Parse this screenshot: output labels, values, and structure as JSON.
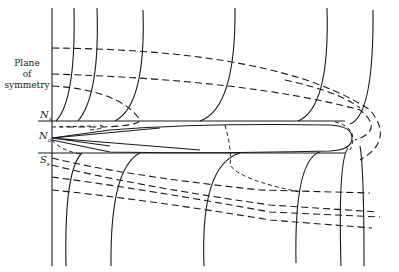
{
  "figure": {
    "labels": {
      "plane_line1": "Plane",
      "plane_line2": "of",
      "plane_line3": "symmetry",
      "ns_main": "N",
      "ns_sub": "s",
      "na_main": "N",
      "na_sub": "a",
      "ss_main": "S",
      "ss_sub": "s"
    },
    "legend": {
      "solid_lines": "field lines",
      "dashed_lines": "contours"
    },
    "colors": {
      "ink": "#1a1a1a",
      "background": "#ffffff"
    }
  }
}
